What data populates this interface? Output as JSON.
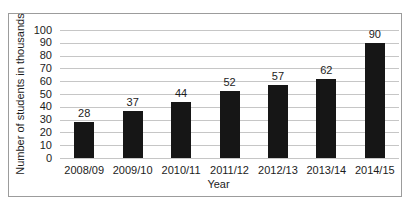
{
  "chart_data": {
    "type": "bar",
    "title": "",
    "categories": [
      "2008/09",
      "2009/10",
      "2010/11",
      "2011/12",
      "2012/13",
      "2013/14",
      "2014/15"
    ],
    "values": [
      28,
      37,
      44,
      52,
      57,
      62,
      90
    ],
    "xlabel": "Year",
    "ylabel": "Number of students in thousands",
    "ylim": [
      0,
      100
    ],
    "ytick_step": 10,
    "grid": true,
    "legend": "none",
    "bar_color": "#161616",
    "gridline_color": "#c6c6c6",
    "frame_border_color": "#9c9c9c",
    "text_color": "#1c1c1c",
    "background_color": "#ffffff"
  }
}
